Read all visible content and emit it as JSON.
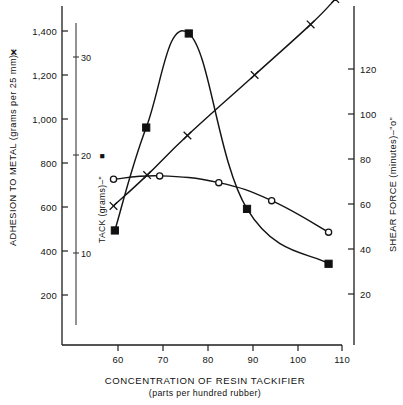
{
  "figure": {
    "background_color": "#ffffff",
    "ink_color": "#141414"
  },
  "axes": {
    "left": {
      "title": "ADHESION TO METAL (grams per 25 mm)–",
      "title_marker": "✕",
      "ticks": [
        "200",
        "400",
        "600",
        "800",
        "1,000",
        "1,200",
        "1,400"
      ]
    },
    "inner_left": {
      "title": "TACK (grams)–\"",
      "title_marker": "■",
      "ticks": [
        "10",
        "20",
        "30"
      ]
    },
    "right": {
      "title": "SHEAR  FORCE  (minutes)–\"o\"",
      "ticks": [
        "20",
        "40",
        "60",
        "80",
        "100",
        "120"
      ]
    },
    "bottom": {
      "title": "CONCENTRATION OF RESIN TACKIFIER",
      "subtitle": "(parts per hundred rubber)",
      "ticks": [
        "60",
        "70",
        "80",
        "90",
        "100",
        "110"
      ]
    }
  },
  "chart_data": {
    "type": "line",
    "title": "",
    "xlabel": "CONCENTRATION OF RESIN TACKIFIER (parts per hundred rubber)",
    "xlim": [
      55,
      110
    ],
    "grid": false,
    "legend": "inline-axis-labels",
    "series": [
      {
        "name": "ADHESION TO METAL (grams per 25 mm)",
        "marker": "cross",
        "axis": "left",
        "unit": "grams per 25 mm",
        "ylabel": "ADHESION TO METAL (grams per 25 mm)",
        "ylim": [
          0,
          1500
        ],
        "x": [
          59.0,
          66.5,
          75.5,
          90.5,
          103.0,
          108.5
        ],
        "y": [
          605,
          745,
          925,
          1200,
          1430,
          1545
        ]
      },
      {
        "name": "TACK (grams)",
        "marker": "square",
        "axis": "inner_left",
        "unit": "grams",
        "ylabel": "TACK (grams)",
        "ylim": [
          4.5,
          35.5
        ],
        "x": [
          59.3,
          66.3,
          75.8,
          88.8,
          107.0
        ],
        "y": [
          12.3,
          22.8,
          32.4,
          14.5,
          8.9
        ]
      },
      {
        "name": "SHEAR FORCE (minutes)",
        "marker": "circle",
        "axis": "right",
        "unit": "minutes",
        "ylabel": "SHEAR FORCE (minutes)",
        "ylim": [
          0,
          140
        ],
        "x": [
          59.0,
          69.3,
          82.5,
          94.3,
          107.0
        ],
        "y": [
          71,
          72.5,
          69.5,
          61.5,
          47.5
        ]
      }
    ]
  }
}
